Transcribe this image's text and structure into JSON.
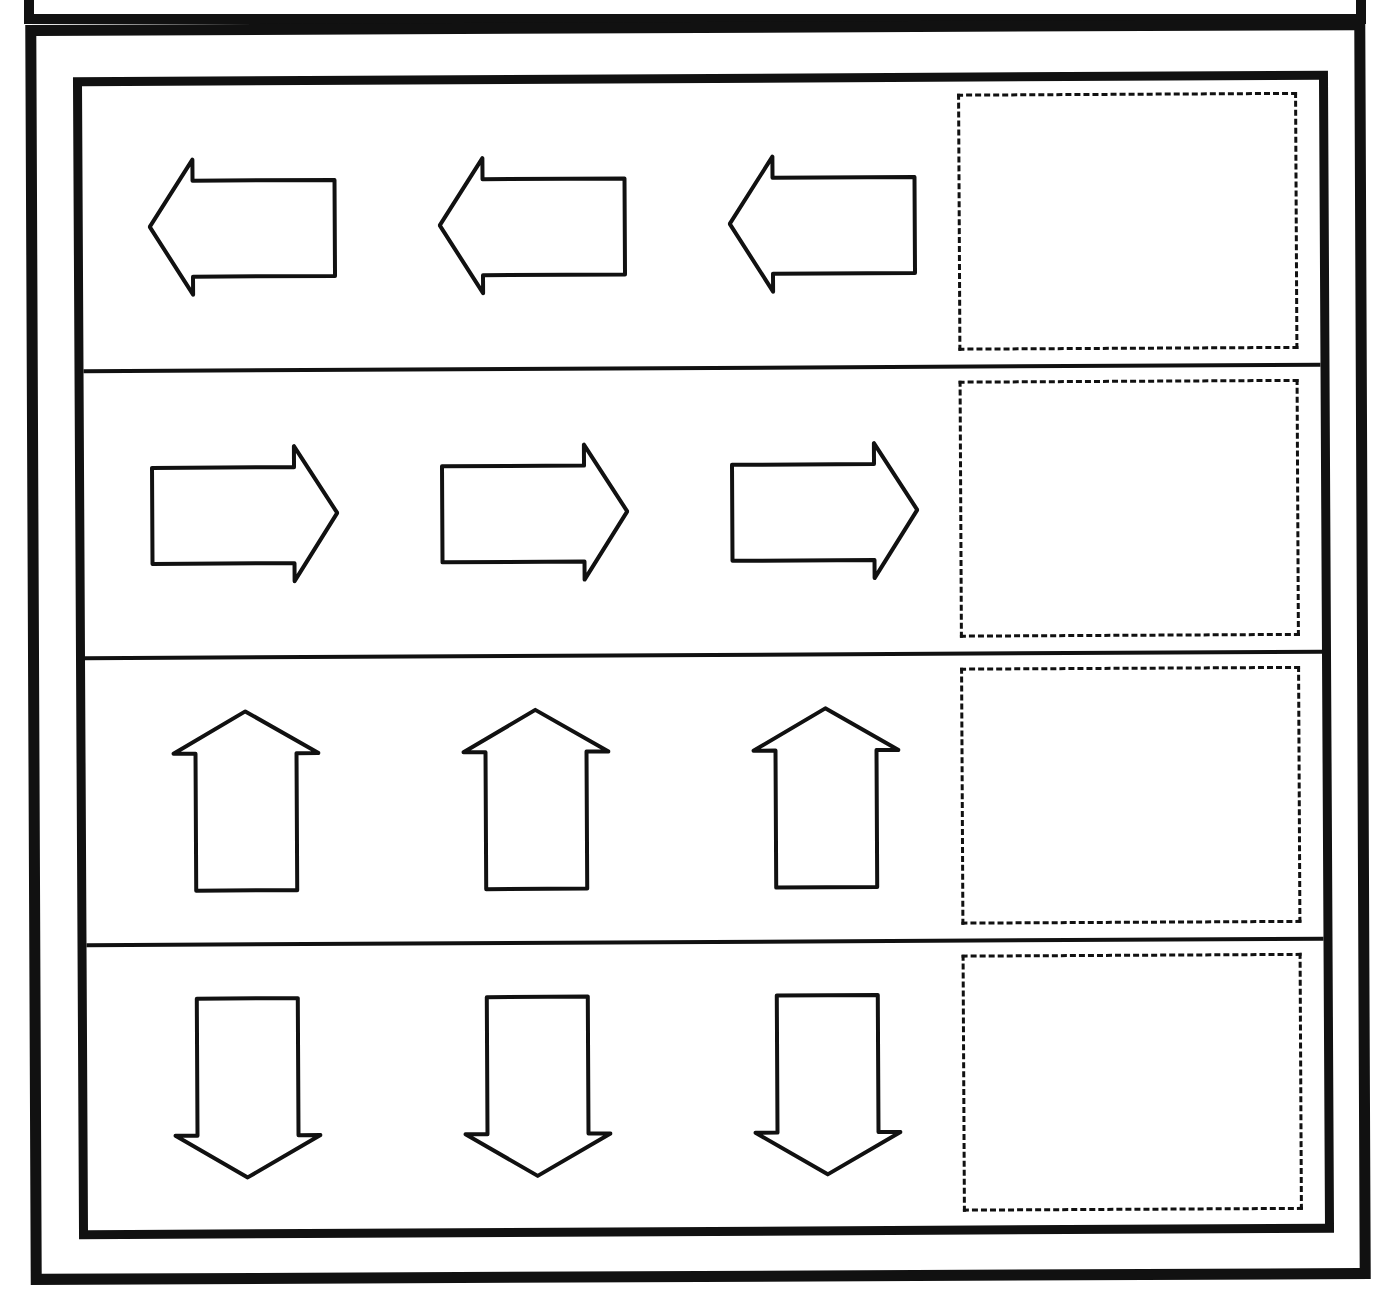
{
  "worksheet": {
    "type": "arrow-direction-pattern",
    "colors": {
      "ink": "#111111",
      "paper": "#ffffff"
    },
    "rows": [
      {
        "direction": "left",
        "arrows": [
          "arrow-left-icon",
          "arrow-left-icon",
          "arrow-left-icon"
        ],
        "answer_box": ""
      },
      {
        "direction": "right",
        "arrows": [
          "arrow-right-icon",
          "arrow-right-icon",
          "arrow-right-icon"
        ],
        "answer_box": ""
      },
      {
        "direction": "up",
        "arrows": [
          "arrow-up-icon",
          "arrow-up-icon",
          "arrow-up-icon"
        ],
        "answer_box": ""
      },
      {
        "direction": "down",
        "arrows": [
          "arrow-down-icon",
          "arrow-down-icon",
          "arrow-down-icon"
        ],
        "answer_box": ""
      }
    ]
  }
}
